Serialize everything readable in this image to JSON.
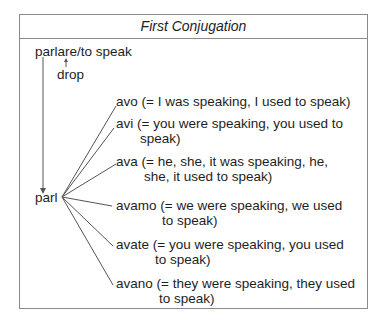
{
  "title": "First Conjugation",
  "infinitive": "parlare/to speak",
  "drop_label": "drop",
  "stem": "parl",
  "endings": [
    {
      "line1": "avo (= I was speaking, I used to speak)",
      "line2": ""
    },
    {
      "line1": "avi (= you were speaking, you used to",
      "line2": "speak)"
    },
    {
      "line1": "ava (= he, she, it was speaking, he,",
      "line2": "she, it used to speak)"
    },
    {
      "line1": "avamo (= we were speaking, we used",
      "line2": "to speak)"
    },
    {
      "line1": "avate (= you were speaking, you used",
      "line2": "to speak)"
    },
    {
      "line1": "avano (= they were speaking, they used",
      "line2": "to speak)"
    }
  ]
}
